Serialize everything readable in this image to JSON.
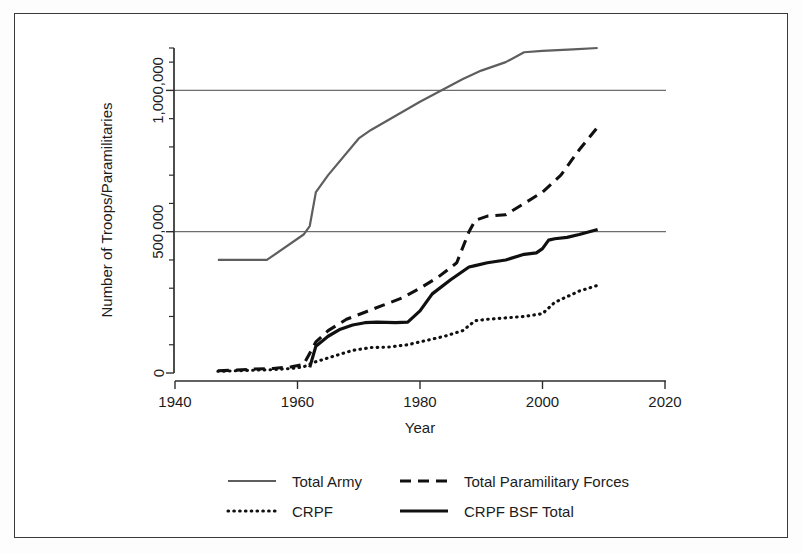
{
  "chart_data": {
    "type": "line",
    "title": "",
    "xlabel": "Year",
    "ylabel": "Number of Troops/Paramilitaries",
    "xlim": [
      1940,
      2020
    ],
    "ylim": [
      0,
      1150000
    ],
    "xticks": [
      1940,
      1960,
      1980,
      2000,
      2020
    ],
    "xticklabels": [
      "1940",
      "1960",
      "1980",
      "2000",
      "2020"
    ],
    "yticks": [
      0,
      500000,
      1000000
    ],
    "yticklabels": [
      "0",
      "500,000",
      "1,000,000"
    ],
    "yminorticks": [
      100000,
      200000,
      300000,
      400000,
      600000,
      700000,
      800000,
      900000,
      1100000
    ],
    "grid": "horizontal-at-major-y",
    "gridlines": [
      500000,
      1000000
    ],
    "legend_position": "below-axes",
    "series": [
      {
        "name": "Total Army",
        "style": "solid-thin",
        "color": "#5e5e5e",
        "x": [
          1947,
          1955,
          1961,
          1962,
          1963,
          1965,
          1970,
          1972,
          1980,
          1987,
          1990,
          1994,
          1997,
          2000,
          2005,
          2009
        ],
        "values": [
          400000,
          400000,
          490000,
          520000,
          640000,
          700000,
          830000,
          860000,
          960000,
          1040000,
          1070000,
          1100000,
          1135000,
          1140000,
          1145000,
          1150000
        ]
      },
      {
        "name": "Total Paramilitary Forces",
        "style": "dashed",
        "color": "#101010",
        "x": [
          1947,
          1950,
          1953,
          1956,
          1959,
          1961,
          1963,
          1965,
          1968,
          1971,
          1974,
          1977,
          1980,
          1983,
          1986,
          1988,
          1989,
          1991,
          1994,
          1997,
          2000,
          2003,
          2006,
          2009
        ],
        "values": [
          8000,
          10000,
          14000,
          16000,
          22000,
          30000,
          110000,
          150000,
          190000,
          215000,
          240000,
          265000,
          300000,
          340000,
          390000,
          500000,
          540000,
          555000,
          560000,
          600000,
          640000,
          700000,
          790000,
          870000
        ]
      },
      {
        "name": "CRPF",
        "style": "dotted",
        "color": "#101010",
        "x": [
          1947,
          1950,
          1953,
          1956,
          1959,
          1961,
          1963,
          1966,
          1969,
          1972,
          1975,
          1978,
          1981,
          1984,
          1987,
          1989,
          1991,
          1994,
          1997,
          2000,
          2002,
          2004,
          2006,
          2009
        ],
        "values": [
          6000,
          8000,
          10000,
          12000,
          16000,
          22000,
          40000,
          60000,
          80000,
          90000,
          92000,
          100000,
          115000,
          130000,
          150000,
          185000,
          190000,
          195000,
          200000,
          210000,
          250000,
          270000,
          290000,
          310000
        ]
      },
      {
        "name": "CRPF BSF Total",
        "style": "solid-thick",
        "color": "#101010",
        "x": [
          1962,
          1963,
          1965,
          1967,
          1969,
          1971,
          1973,
          1976,
          1978,
          1980,
          1982,
          1985,
          1988,
          1989,
          1991,
          1994,
          1997,
          1999,
          2000,
          2001,
          2002,
          2004,
          2006,
          2009
        ],
        "values": [
          20000,
          95000,
          130000,
          155000,
          170000,
          178000,
          180000,
          178000,
          180000,
          220000,
          280000,
          330000,
          375000,
          380000,
          390000,
          400000,
          420000,
          425000,
          440000,
          470000,
          475000,
          480000,
          490000,
          508000
        ]
      }
    ]
  },
  "legend": {
    "entries": [
      {
        "label": "Total Army",
        "style": "solid-thin"
      },
      {
        "label": "Total Paramilitary Forces",
        "style": "dashed"
      },
      {
        "label": "CRPF",
        "style": "dotted"
      },
      {
        "label": "CRPF BSF Total",
        "style": "solid-thick"
      }
    ]
  }
}
